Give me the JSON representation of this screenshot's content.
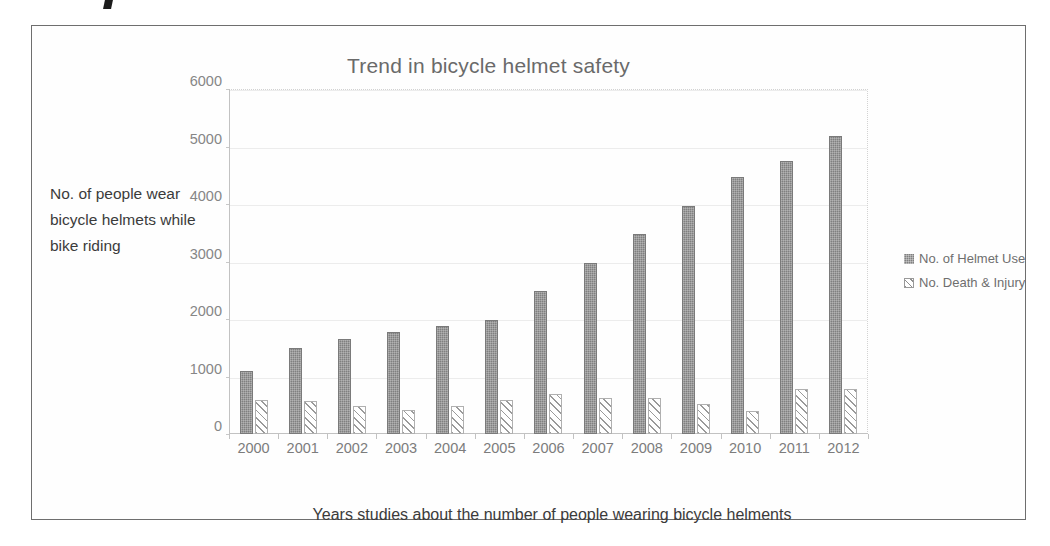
{
  "figure": {
    "title": "Trend in bicycle helmet safety",
    "y_axis_title": "No. of people wear bicycle helmets while bike riding",
    "x_axis_title": "Years studies about the number of people wearing bicycle helments",
    "frame_color": "#6e6e6e",
    "series_colors": {
      "helmet_use": "#808080",
      "death_injury": "#ffffff"
    }
  },
  "legend": {
    "position": "right",
    "items": [
      {
        "label": "No. of Helmet Use",
        "swatch": "solid-gray-swatch"
      },
      {
        "label": "No. Death & Injury",
        "swatch": "hatched-swatch"
      }
    ]
  },
  "chart_data": {
    "type": "bar",
    "title": "Trend in bicycle helmet safety",
    "xlabel": "Years studies about the number of people wearing bicycle helments",
    "ylabel": "No. of people wear bicycle helmets while bike riding",
    "categories": [
      "2000",
      "2001",
      "2002",
      "2003",
      "2004",
      "2005",
      "2006",
      "2007",
      "2008",
      "2009",
      "2010",
      "2011",
      "2012"
    ],
    "ylim": [
      0,
      6000
    ],
    "yticks": [
      0,
      1000,
      2000,
      3000,
      4000,
      5000,
      6000
    ],
    "ytick_labels": [
      "0",
      "1000",
      "2000",
      "3000",
      "4000",
      "5000",
      "6000"
    ],
    "grid": true,
    "legend_position": "right",
    "series": [
      {
        "name": "No. of Helmet Use",
        "values": [
          1100,
          1500,
          1650,
          1780,
          1880,
          1980,
          2480,
          2980,
          3480,
          3970,
          4470,
          4740,
          5190
        ]
      },
      {
        "name": "No. Death & Injury",
        "values": [
          600,
          580,
          490,
          420,
          480,
          590,
          690,
          630,
          620,
          520,
          400,
          790,
          780
        ]
      }
    ]
  }
}
